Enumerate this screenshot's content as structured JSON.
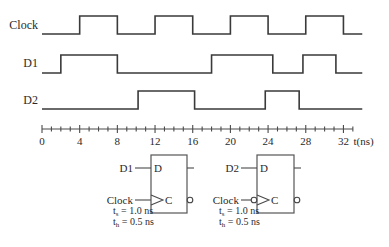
{
  "signals": [
    {
      "label": "Clock",
      "label_x": 38,
      "label_y": 29,
      "high_y": 16,
      "low_y": 34,
      "initial": 0,
      "edges": [
        4,
        8,
        12,
        16,
        20,
        24,
        28,
        32
      ],
      "end": 34
    },
    {
      "label": "D1",
      "label_x": 38,
      "label_y": 67,
      "high_y": 55,
      "low_y": 73,
      "initial": 0,
      "edges": [
        2,
        8,
        18,
        24.5,
        27.7,
        31.2
      ],
      "end": 34
    },
    {
      "label": "D2",
      "label_x": 38,
      "label_y": 104,
      "high_y": 91,
      "low_y": 109,
      "initial": 0,
      "edges": [
        10.2,
        16.2,
        23.7,
        27.3
      ],
      "end": 34
    }
  ],
  "axis": {
    "y": 129,
    "t_start": 0,
    "t_end": 33,
    "px_per_ns": 9.42,
    "x0": 42,
    "minor_step": 1,
    "major_step": 4,
    "tick_labels": [
      "0",
      "4",
      "8",
      "12",
      "16",
      "20",
      "24",
      "28",
      "32"
    ],
    "unit_label": "t(ns)"
  },
  "flipflops": [
    {
      "name": "ff1",
      "x": 151,
      "y": 155,
      "w": 36,
      "h": 58,
      "d_input_label": "D1",
      "d_pin": "D",
      "c_pin": "C",
      "clock_label": "Clock",
      "clock_inverted": false,
      "ts": "t",
      "ts_sub": "s",
      "ts_value": " = 1.0 ns",
      "th": "t",
      "th_sub": "h",
      "th_value": " = 0.5 ns"
    },
    {
      "name": "ff2",
      "x": 257,
      "y": 155,
      "w": 37,
      "h": 58,
      "d_input_label": "D2",
      "d_pin": "D",
      "c_pin": "C",
      "clock_label": "Clock",
      "clock_inverted": true,
      "ts": "t",
      "ts_sub": "s",
      "ts_value": " = 1.0 ns",
      "th": "t",
      "th_sub": "h",
      "th_value": " = 0.5 ns"
    }
  ]
}
